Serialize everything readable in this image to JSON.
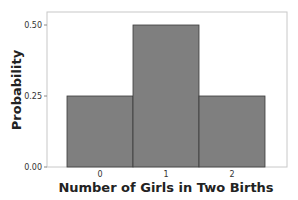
{
  "chart_data": {
    "type": "bar",
    "title": "",
    "xlabel": "Number of Girls in Two Births",
    "ylabel": "Probability",
    "categories": [
      "0",
      "1",
      "2"
    ],
    "values": [
      0.25,
      0.5,
      0.25
    ],
    "ylim": [
      0,
      0.55
    ],
    "yticks": [
      "0.00",
      "0.25",
      "0.50"
    ],
    "grid": false,
    "legend": null,
    "bar_color": "#7f7f7f",
    "bar_edge_color": "#3a3a3a"
  }
}
